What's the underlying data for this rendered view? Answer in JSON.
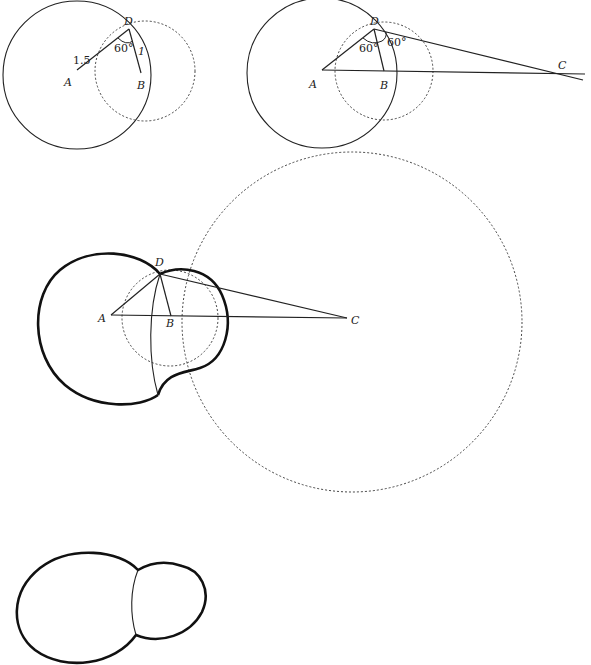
{
  "diagram": {
    "panels": [
      {
        "id": "panel-1",
        "points": {
          "A": "A",
          "B": "B",
          "D": "D"
        },
        "labels": {
          "AD_length": "1.5",
          "DB_length": "1",
          "angle_ADB": "60°"
        },
        "geometry": {
          "A": [
            77,
            73
          ],
          "D": [
            129,
            28
          ],
          "B": [
            141,
            75
          ],
          "solid_circle": {
            "center": "A",
            "cx": 77,
            "cy": 75,
            "r": 74
          },
          "dotted_circle": {
            "center": "B",
            "cx": 145,
            "cy": 71,
            "r": 50
          }
        }
      },
      {
        "id": "panel-2",
        "points": {
          "A": "A",
          "B": "B",
          "C": "C",
          "D": "D"
        },
        "labels": {
          "angle_ADB": "60°",
          "angle_BDC": "60°"
        },
        "geometry": {
          "A": [
            323,
            70
          ],
          "D": [
            374,
            28
          ],
          "B": [
            384,
            72
          ],
          "C": [
            566,
            74
          ],
          "solid_circle": {
            "center": "A",
            "cx": 322,
            "cy": 73,
            "r": 75
          },
          "dotted_circle": {
            "center": "B",
            "cx": 384,
            "cy": 71,
            "r": 49
          }
        }
      },
      {
        "id": "panel-3",
        "points": {
          "A": "A",
          "B": "B",
          "C": "C",
          "D": "D"
        },
        "geometry": {
          "A": [
            111,
            315
          ],
          "D": [
            160,
            274
          ],
          "B": [
            171,
            316
          ],
          "C": [
            347,
            318
          ],
          "large_dotted_circle": {
            "center": "C",
            "cx": 352,
            "cy": 322,
            "r": 170
          },
          "small_dotted_circle": {
            "center": "B",
            "cx": 170,
            "cy": 318,
            "r": 48
          },
          "bold_outline": "union of circle A and circle B, joined at D and lower intersection",
          "inner_arc": "thin arc of large circle C between the two intersection points"
        }
      },
      {
        "id": "panel-4",
        "description": "final shape: two merged circles divided by a thin arc",
        "geometry": {
          "big_lobe_center": [
            87,
            582
          ],
          "big_lobe_r": 73,
          "small_lobe_center": [
            170,
            591
          ],
          "small_lobe_r": 37
        }
      }
    ]
  }
}
